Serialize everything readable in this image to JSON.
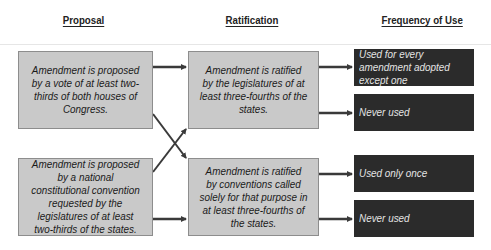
{
  "headers": {
    "proposal": "Proposal",
    "ratification": "Ratification",
    "frequency": "Frequency of Use"
  },
  "proposal": [
    {
      "text": "Amendment is proposed by a vote of at least two-thirds of both houses of Congress."
    },
    {
      "text": "Amendment is proposed by a national constitutional convention requested by the legislatures of at least two-thirds of the states."
    }
  ],
  "ratification": [
    {
      "text": "Amendment is ratified by the legislatures of at least three-fourths of the states."
    },
    {
      "text": "Amendment is ratified by conventions called solely for that purpose in at least three-fourths of the states."
    }
  ],
  "frequency": [
    {
      "text": "Used for every amendment adopted except one"
    },
    {
      "text": "Never used"
    },
    {
      "text": "Used only once"
    },
    {
      "text": "Never used"
    }
  ],
  "colors": {
    "light_box": "#c9c9c9",
    "dark_box": "#2b2b2b",
    "arrow": "#3a3a3a"
  }
}
